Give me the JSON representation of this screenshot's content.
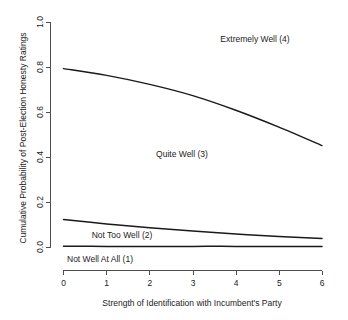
{
  "chart_data": {
    "type": "line",
    "title": "",
    "subtitle": "",
    "xlabel": "Strength of Identification with Incumbent's Party",
    "ylabel": "Cumulative Probability of Post-Election Honesty Ratings",
    "xlim": [
      0,
      6
    ],
    "ylim": [
      0.0,
      1.0
    ],
    "grid": false,
    "legend_position": "none",
    "xticks": [
      "0",
      "1",
      "2",
      "3",
      "4",
      "5",
      "6"
    ],
    "xtick_values": [
      0,
      1,
      2,
      3,
      4,
      5,
      6
    ],
    "yticks": [
      "0.0",
      "0.2",
      "0.4",
      "0.6",
      "0.8",
      "1.0"
    ],
    "ytick_values": [
      0.0,
      0.2,
      0.4,
      0.6,
      0.8,
      1.0
    ],
    "x": [
      0,
      1,
      2,
      3,
      4,
      5,
      6
    ],
    "series": [
      {
        "name": "Cumulative boundary: Quite Well (3) / Extremely Well (4)",
        "values": [
          0.795,
          0.765,
          0.725,
          0.675,
          0.61,
          0.535,
          0.453
        ]
      },
      {
        "name": "Cumulative boundary: Not Too Well (2) / Quite Well (3)",
        "values": [
          0.124,
          0.105,
          0.088,
          0.073,
          0.06,
          0.049,
          0.04
        ]
      },
      {
        "name": "Cumulative boundary: Not Well At All (1) / Not Too Well (2)",
        "values": [
          0.006,
          0.005,
          0.005,
          0.005,
          0.005,
          0.004,
          0.004
        ]
      }
    ],
    "annotations": [
      {
        "text": "Extremely Well (4)",
        "x": 4.45,
        "y": 0.905
      },
      {
        "text": "Quite Well (3)",
        "x": 2.75,
        "y": 0.4
      },
      {
        "text": "Not Too Well (2)",
        "x": 1.35,
        "y": 0.085
      },
      {
        "text": "Not Well At All (1)",
        "x": 0.85,
        "y": -0.045
      }
    ]
  },
  "axis": {
    "x_title": "Strength of Identification with Incumbent's Party",
    "y_title": "Cumulative Probability of Post-Election Honesty Ratings",
    "x_tick_labels": [
      "0",
      "1",
      "2",
      "3",
      "4",
      "5",
      "6"
    ],
    "y_tick_labels": [
      "0.0",
      "0.2",
      "0.4",
      "0.6",
      "0.8",
      "1.0"
    ]
  },
  "annotations": {
    "extremely_well": "Extremely Well (4)",
    "quite_well": "Quite Well (3)",
    "not_too_well": "Not Too Well (2)",
    "not_well_at_all": "Not Well At All (1)"
  },
  "colors": {
    "background": "#ffffff",
    "curve": "#1a1a1a",
    "axis": "#4d4d4d",
    "text": "#222222"
  }
}
